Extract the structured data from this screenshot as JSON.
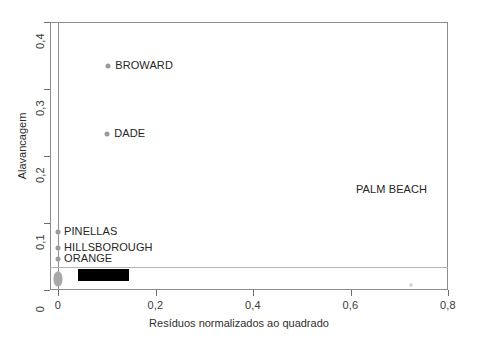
{
  "chart_data": {
    "type": "scatter",
    "title": "",
    "xlabel": "Resíduos normalizados ao quadrado",
    "ylabel": "Alavancagem",
    "xlim": [
      -0.02,
      0.82
    ],
    "ylim": [
      -0.01,
      0.415
    ],
    "xticks": [
      "0",
      "0,2",
      "0,4",
      "0,6",
      "0,8"
    ],
    "xtick_values": [
      0,
      0.2,
      0.4,
      0.6,
      0.8
    ],
    "yticks": [
      "0",
      "0,1",
      "0,2",
      "0,3",
      "0,4"
    ],
    "ytick_values": [
      0,
      0.1,
      0.2,
      0.3,
      0.4
    ],
    "grid": false,
    "legend": "none",
    "reference_line_y": 0.035,
    "reference_line_x": 0.0,
    "points": [
      {
        "label": "BROWARD",
        "x": 0.103,
        "y": 0.334,
        "label_dx": 7,
        "label_dy": 0
      },
      {
        "label": "DADE",
        "x": 0.101,
        "y": 0.233,
        "label_dx": 7,
        "label_dy": 0
      },
      {
        "label": "PALM BEACH",
        "x": 0.8,
        "y": 0.15,
        "label_dx": -92,
        "label_dy": 0
      },
      {
        "label": "PINELLAS",
        "x": 0.0,
        "y": 0.086,
        "label_dx": 6,
        "label_dy": 0
      },
      {
        "label": "HILLSBOROUGH",
        "x": 0.0,
        "y": 0.062,
        "label_dx": 6,
        "label_dy": 0
      },
      {
        "label": "ORANGE",
        "x": 0.0,
        "y": 0.047,
        "label_dx": 6,
        "label_dy": 0
      },
      {
        "label": "",
        "x": 0.725,
        "y": 0.007,
        "label_dx": 0,
        "label_dy": 0
      }
    ],
    "cluster": {
      "description": "dense overlapping points at x≈0 near y≈0 to 0.03",
      "x": 0.0,
      "y": 0.017
    },
    "redacted_label": {
      "description": "black redaction bar covering a point label",
      "x_start": 0.04,
      "x_end": 0.145,
      "y": 0.023
    }
  },
  "colors": {
    "point": "#9a9a9a",
    "frame": "#8c8c8c",
    "reference_line": "#b4b4b4",
    "text": "#262626",
    "redaction": "#000000",
    "background": "#ffffff"
  }
}
